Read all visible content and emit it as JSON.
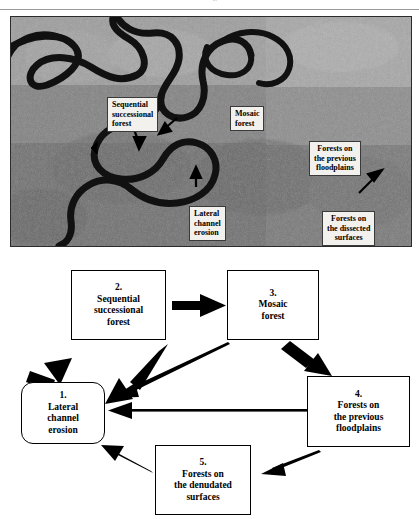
{
  "page": {
    "cropped_caption_sliver": "l                       f                 g",
    "background_color": "#ffffff"
  },
  "photo": {
    "name": "aerial-satellite-photo-meandering-river",
    "description": "Black and white aerial/satellite photograph of a meandering river with floodplain forests",
    "labels": [
      {
        "id": "sequential-successional-forest",
        "text": "Sequential\nsuccessional\nforest",
        "align": "left"
      },
      {
        "id": "mosaic-forest",
        "text": "Mosaic\nforest",
        "align": "left"
      },
      {
        "id": "forests-on-the-previous-floodplains",
        "text": "Forests  on\nthe  previous\nfloodplains",
        "align": "center"
      },
      {
        "id": "lateral-channel-erosion",
        "text": "Lateral\nchannel\nerosion",
        "align": "left"
      },
      {
        "id": "forests-on-the-dissected-surfaces",
        "text": "Forests  on\nthe  dissected\nsurfaces",
        "align": "center"
      }
    ]
  },
  "diagram": {
    "type": "cycle-flow-diagram",
    "boxes": [
      {
        "number": "1.",
        "label": "1.\nLateral\nchannel\nerosion",
        "shape": "rounded-rectangle"
      },
      {
        "number": "2.",
        "label": "2.\nSequential\nsuccessional\nforest",
        "shape": "rectangle"
      },
      {
        "number": "3.",
        "label": "3.\nMosaic\nforest",
        "shape": "rectangle"
      },
      {
        "number": "4.",
        "label": "4.\nForests  on\nthe  previous\nfloodplains",
        "shape": "rectangle"
      },
      {
        "number": "5.",
        "label": "5.\nForests  on\nthe  denudated\nsurfaces",
        "shape": "rectangle"
      }
    ],
    "arrows": [
      {
        "from": "1",
        "to": "2",
        "weight": "thick"
      },
      {
        "from": "2",
        "to": "1",
        "weight": "thick"
      },
      {
        "from": "2",
        "to": "3",
        "weight": "thick"
      },
      {
        "from": "3",
        "to": "1",
        "weight": "thin"
      },
      {
        "from": "3",
        "to": "4",
        "weight": "thick"
      },
      {
        "from": "4",
        "to": "1",
        "weight": "thin"
      },
      {
        "from": "4",
        "to": "5",
        "weight": "thin"
      },
      {
        "from": "5",
        "to": "1",
        "weight": "thin"
      }
    ],
    "line_color": "#000000"
  }
}
